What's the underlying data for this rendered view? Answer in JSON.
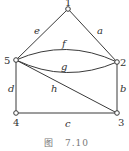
{
  "figure": {
    "caption_prefix": "图",
    "caption_number": "7.10"
  },
  "graph": {
    "vertices": [
      {
        "id": "1",
        "label": "1"
      },
      {
        "id": "2",
        "label": "2"
      },
      {
        "id": "3",
        "label": "3"
      },
      {
        "id": "4",
        "label": "4"
      },
      {
        "id": "5",
        "label": "5"
      }
    ],
    "edges": [
      {
        "id": "a",
        "label": "a",
        "from": "1",
        "to": "2"
      },
      {
        "id": "b",
        "label": "b",
        "from": "2",
        "to": "3"
      },
      {
        "id": "c",
        "label": "c",
        "from": "3",
        "to": "4"
      },
      {
        "id": "d",
        "label": "d",
        "from": "4",
        "to": "5"
      },
      {
        "id": "e",
        "label": "e",
        "from": "5",
        "to": "1"
      },
      {
        "id": "f",
        "label": "f",
        "from": "5",
        "to": "2"
      },
      {
        "id": "g",
        "label": "g",
        "from": "5",
        "to": "2"
      },
      {
        "id": "h",
        "label": "h",
        "from": "5",
        "to": "3"
      }
    ]
  }
}
